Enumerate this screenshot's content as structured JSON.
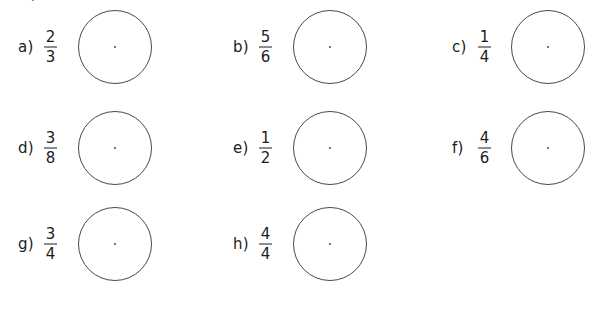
{
  "page": {
    "background_color": "#ffffff",
    "top_clipped_text": "y"
  },
  "style": {
    "circle_stroke_color": "#4a4a4a",
    "text_color": "#1c1c1c",
    "circle_fill": "#ffffff",
    "center_dot_color": "#3a3a3a"
  },
  "problems": [
    {
      "label": "a)",
      "numerator": "2",
      "denominator": "3",
      "col": 0,
      "row": 0
    },
    {
      "label": "b)",
      "numerator": "5",
      "denominator": "6",
      "col": 1,
      "row": 0
    },
    {
      "label": "c)",
      "numerator": "1",
      "denominator": "4",
      "col": 2,
      "row": 0
    },
    {
      "label": "d)",
      "numerator": "3",
      "denominator": "8",
      "col": 0,
      "row": 1
    },
    {
      "label": "e)",
      "numerator": "1",
      "denominator": "2",
      "col": 1,
      "row": 1
    },
    {
      "label": "f)",
      "numerator": "4",
      "denominator": "6",
      "col": 2,
      "row": 1
    },
    {
      "label": "g)",
      "numerator": "3",
      "denominator": "4",
      "col": 0,
      "row": 2
    },
    {
      "label": "h)",
      "numerator": "4",
      "denominator": "4",
      "col": 1,
      "row": 2
    }
  ],
  "geometry": {
    "column_x": [
      18,
      233,
      452
    ],
    "row_y": [
      47,
      148,
      244
    ],
    "circle_diameter": 73,
    "circle_offset_x": [
      59,
      59,
      58
    ]
  }
}
